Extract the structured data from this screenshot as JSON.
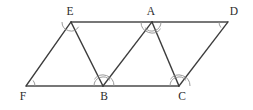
{
  "figure": {
    "type": "line-diagram",
    "canvas": {
      "width": 253,
      "height": 110
    },
    "colors": {
      "background": "#ffffff",
      "line": "#3c3c3c",
      "rail": "#4a4a4a",
      "arc": "#8f8f8f",
      "label": "#2b2b2b"
    },
    "points": {
      "E": {
        "label": "E",
        "x": 71,
        "y": 22,
        "label_x": 70,
        "label_y": 12
      },
      "A": {
        "label": "A",
        "x": 152,
        "y": 22,
        "label_x": 151,
        "label_y": 12
      },
      "D": {
        "label": "D",
        "x": 228,
        "y": 22,
        "label_x": 234,
        "label_y": 12
      },
      "F": {
        "label": "F",
        "x": 26,
        "y": 86,
        "label_x": 23,
        "label_y": 97
      },
      "B": {
        "label": "B",
        "x": 103,
        "y": 86,
        "label_x": 104,
        "label_y": 97
      },
      "C": {
        "label": "C",
        "x": 179,
        "y": 86,
        "label_x": 182,
        "label_y": 97
      }
    },
    "segments": [
      {
        "name": "top-rail-E-D",
        "from": "E",
        "to": "D",
        "style": "rail"
      },
      {
        "name": "bottom-rail-F-C",
        "from": "F",
        "to": "C",
        "style": "rail"
      },
      {
        "name": "edge-F-E",
        "from": "F",
        "to": "E",
        "style": "edge"
      },
      {
        "name": "edge-E-B",
        "from": "E",
        "to": "B",
        "style": "edge"
      },
      {
        "name": "edge-B-A",
        "from": "B",
        "to": "A",
        "style": "edge"
      },
      {
        "name": "edge-A-C",
        "from": "A",
        "to": "C",
        "style": "edge"
      },
      {
        "name": "edge-C-D",
        "from": "C",
        "to": "D",
        "style": "edge"
      }
    ],
    "angle_arcs": [
      {
        "name": "angle-arc-E",
        "at": "E",
        "radius": 9,
        "start_deg": 32,
        "end_deg": 180
      },
      {
        "name": "angle-arc-A-left",
        "at": "A",
        "radius": 9,
        "start_deg": 0,
        "end_deg": 142
      },
      {
        "name": "angle-arc-A-right",
        "at": "A",
        "radius": 11,
        "start_deg": 38,
        "end_deg": 180
      },
      {
        "name": "angle-arc-D",
        "at": "D",
        "radius": 9,
        "start_deg": 142,
        "end_deg": 180
      },
      {
        "name": "angle-arc-F",
        "at": "F",
        "radius": 9,
        "start_deg": -38,
        "end_deg": 0
      },
      {
        "name": "angle-arc-B-left",
        "at": "B",
        "radius": 9,
        "start_deg": -180,
        "end_deg": -38
      },
      {
        "name": "angle-arc-B-right",
        "at": "B",
        "radius": 11,
        "start_deg": -142,
        "end_deg": 0
      },
      {
        "name": "angle-arc-C-left",
        "at": "C",
        "radius": 9,
        "start_deg": -180,
        "end_deg": -38
      },
      {
        "name": "angle-arc-C-right",
        "at": "C",
        "radius": 11,
        "start_deg": -142,
        "end_deg": 0
      }
    ]
  }
}
